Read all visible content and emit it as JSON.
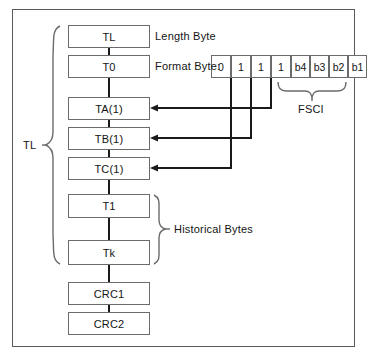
{
  "diagram": {
    "title_absent": true,
    "frame_border_color": "#5a5a5a",
    "box_border_color": "#6b6b6b",
    "line_color": "#1a1a1a",
    "brace_color": "#6b6b6b",
    "text_color": "#141414"
  },
  "sequence_boxes": [
    {
      "label": "TL"
    },
    {
      "label": "T0"
    },
    {
      "label": "TA(1)"
    },
    {
      "label": "TB(1)"
    },
    {
      "label": "TC(1)"
    },
    {
      "label": "T1"
    },
    {
      "label": "Tk"
    },
    {
      "label": "CRC1"
    },
    {
      "label": "CRC2"
    }
  ],
  "annotations": {
    "length_byte": "Length Byte",
    "format_byte": "Format Byte:",
    "historical_bytes": "Historical Bytes",
    "fsci": "FSCI",
    "tl_brace": "TL"
  },
  "format_byte_cells": [
    {
      "label": "0"
    },
    {
      "label": "1"
    },
    {
      "label": "1"
    },
    {
      "label": "1"
    },
    {
      "label": "b4"
    },
    {
      "label": "b3"
    },
    {
      "label": "b2"
    },
    {
      "label": "b1"
    }
  ],
  "connections": [
    {
      "from_cell": "1 (bit 8 position 4)",
      "to_box": "TA(1)"
    },
    {
      "from_cell": "1 (bit 8 position 3)",
      "to_box": "TB(1)"
    },
    {
      "from_cell": "1 (bit 8 position 2)",
      "to_box": "TC(1)"
    }
  ]
}
